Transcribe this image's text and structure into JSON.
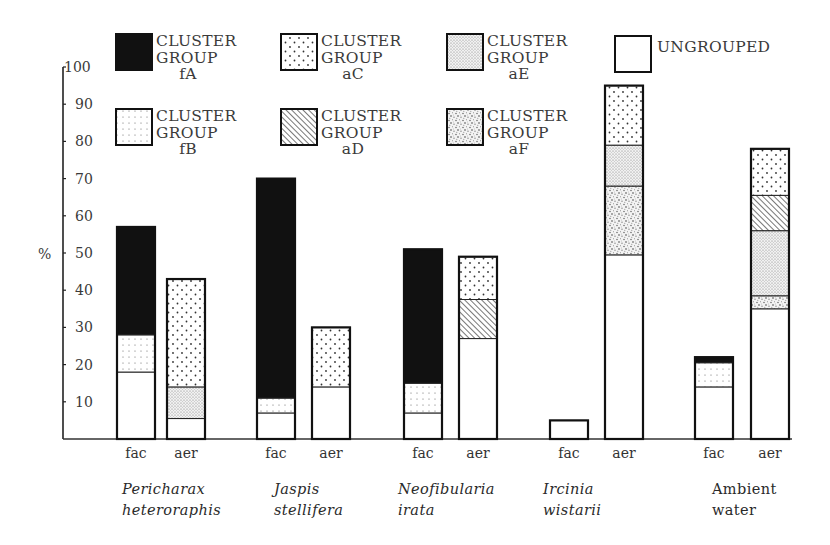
{
  "chart_data": {
    "type": "bar",
    "stacked": true,
    "title": "",
    "xlabel": "",
    "ylabel": "%",
    "ylim": [
      0,
      100
    ],
    "yticks": [
      10,
      20,
      30,
      40,
      50,
      60,
      70,
      80,
      90,
      100
    ],
    "grid": false,
    "legend_position": "top",
    "legend": [
      {
        "key": "fA",
        "lines": [
          "CLUSTER",
          "GROUP",
          "fA"
        ],
        "pattern": "solid-black"
      },
      {
        "key": "aC",
        "lines": [
          "CLUSTER",
          "GROUP",
          "aC"
        ],
        "pattern": "sparse-dots"
      },
      {
        "key": "aE",
        "lines": [
          "CLUSTER",
          "GROUP",
          "aE"
        ],
        "pattern": "fine-stipple"
      },
      {
        "key": "ungrouped",
        "lines": [
          "UNGROUPED"
        ],
        "pattern": "blank"
      },
      {
        "key": "fB",
        "lines": [
          "CLUSTER",
          "GROUP",
          "fB"
        ],
        "pattern": "fine-grid-dots"
      },
      {
        "key": "aD",
        "lines": [
          "CLUSTER",
          "GROUP",
          "aD"
        ],
        "pattern": "diagonal-hatch"
      },
      {
        "key": "aF",
        "lines": [
          "CLUSTER",
          "GROUP",
          "aF"
        ],
        "pattern": "coarse-stipple"
      }
    ],
    "groups": [
      {
        "name": [
          "Pericharax",
          "heteroraphis"
        ],
        "italic": true
      },
      {
        "name": [
          "Jaspis",
          "stellifera"
        ],
        "italic": true
      },
      {
        "name": [
          "Neofibularia",
          "irata"
        ],
        "italic": true
      },
      {
        "name": [
          "Ircinia",
          "wistarii"
        ],
        "italic": true
      },
      {
        "name": [
          "Ambient",
          "water"
        ],
        "italic": false
      }
    ],
    "bars": [
      {
        "group": 0,
        "label": "fac",
        "segments": [
          {
            "key": "ungrouped",
            "value": 18
          },
          {
            "key": "fB",
            "value": 10
          },
          {
            "key": "fA",
            "value": 29
          }
        ]
      },
      {
        "group": 0,
        "label": "aer",
        "segments": [
          {
            "key": "ungrouped",
            "value": 5.5
          },
          {
            "key": "aE",
            "value": 8.5
          },
          {
            "key": "aC",
            "value": 29
          }
        ]
      },
      {
        "group": 1,
        "label": "fac",
        "segments": [
          {
            "key": "ungrouped",
            "value": 7
          },
          {
            "key": "fB",
            "value": 4
          },
          {
            "key": "fA",
            "value": 59
          }
        ]
      },
      {
        "group": 1,
        "label": "aer",
        "segments": [
          {
            "key": "ungrouped",
            "value": 14
          },
          {
            "key": "aC",
            "value": 16
          }
        ]
      },
      {
        "group": 2,
        "label": "fac",
        "segments": [
          {
            "key": "ungrouped",
            "value": 7
          },
          {
            "key": "fB",
            "value": 8
          },
          {
            "key": "fA",
            "value": 36
          }
        ]
      },
      {
        "group": 2,
        "label": "aer",
        "segments": [
          {
            "key": "ungrouped",
            "value": 27
          },
          {
            "key": "aD",
            "value": 10.5
          },
          {
            "key": "aC",
            "value": 11.5
          }
        ]
      },
      {
        "group": 3,
        "label": "fac",
        "segments": [
          {
            "key": "ungrouped",
            "value": 5
          }
        ]
      },
      {
        "group": 3,
        "label": "aer",
        "segments": [
          {
            "key": "ungrouped",
            "value": 49.5
          },
          {
            "key": "aF",
            "value": 18.5
          },
          {
            "key": "aE",
            "value": 11
          },
          {
            "key": "aC",
            "value": 16
          }
        ]
      },
      {
        "group": 4,
        "label": "fac",
        "segments": [
          {
            "key": "ungrouped",
            "value": 14
          },
          {
            "key": "fB",
            "value": 6.5
          },
          {
            "key": "fA",
            "value": 1.5
          }
        ]
      },
      {
        "group": 4,
        "label": "aer",
        "segments": [
          {
            "key": "ungrouped",
            "value": 35
          },
          {
            "key": "aF",
            "value": 3.5
          },
          {
            "key": "aE",
            "value": 17.5
          },
          {
            "key": "aD",
            "value": 9.5
          },
          {
            "key": "aC",
            "value": 12.5
          }
        ]
      }
    ]
  }
}
